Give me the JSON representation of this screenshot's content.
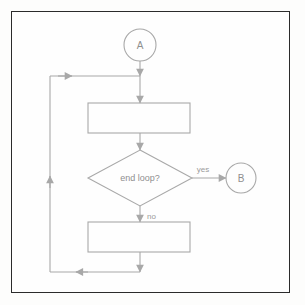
{
  "canvas": {
    "width": 305,
    "height": 305,
    "background": "#fdfdfc",
    "frame_color": "#2b2b2b",
    "stroke_color": "#a8a8a8",
    "text_color": "#8f8f8f"
  },
  "diagram": {
    "type": "flowchart",
    "title": "",
    "nodes": [
      {
        "id": "A",
        "shape": "circle",
        "label": "A",
        "role": "connector-in",
        "cx": 140,
        "cy": 45,
        "r": 16
      },
      {
        "id": "process1",
        "shape": "rectangle",
        "label": "",
        "role": "process",
        "x": 88,
        "y": 103,
        "width": 102,
        "height": 30
      },
      {
        "id": "decision",
        "shape": "diamond",
        "label": "end loop?",
        "role": "decision",
        "cx": 140,
        "cy": 178,
        "half_width": 52,
        "half_height": 28
      },
      {
        "id": "process2",
        "shape": "rectangle",
        "label": "",
        "role": "process",
        "x": 88,
        "y": 222,
        "width": 102,
        "height": 30
      },
      {
        "id": "B",
        "shape": "circle",
        "label": "B",
        "role": "connector-out",
        "cx": 241,
        "cy": 178,
        "r": 15
      }
    ],
    "edges": [
      {
        "id": "a-to-join",
        "from": "A",
        "to": "loop-join",
        "label": ""
      },
      {
        "id": "join-to-process1",
        "from": "loop-join",
        "to": "process1",
        "label": ""
      },
      {
        "id": "process1-to-decision",
        "from": "process1",
        "to": "decision",
        "label": ""
      },
      {
        "id": "decision-yes",
        "from": "decision",
        "to": "B",
        "label": "yes"
      },
      {
        "id": "decision-no",
        "from": "decision",
        "to": "process2",
        "label": "no"
      },
      {
        "id": "process2-to-loop",
        "from": "process2",
        "to": "loop-return",
        "label": ""
      },
      {
        "id": "loop-return",
        "from": "process2",
        "to": "loop-join",
        "label": ""
      }
    ],
    "labels": {
      "yes": "yes",
      "no": "no",
      "decision": "end loop?",
      "connector_in": "A",
      "connector_out": "B"
    }
  }
}
